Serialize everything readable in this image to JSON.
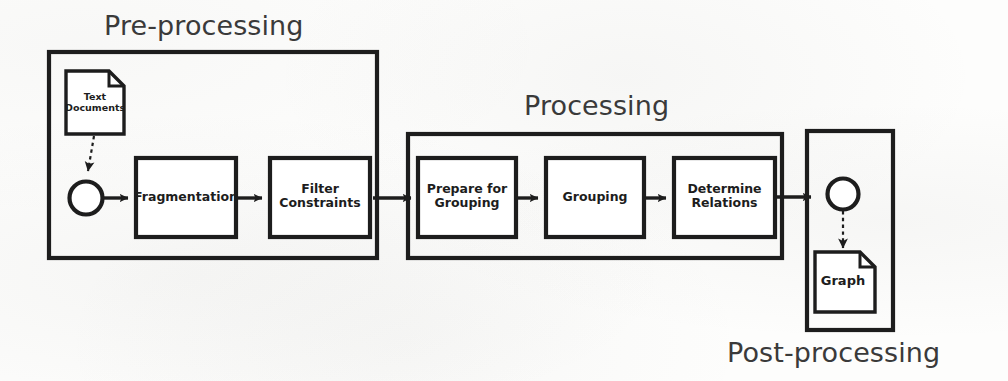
{
  "diagram": {
    "background_color": "#fdfdfc",
    "stroke_color": "#1d1d1d",
    "title_color": "#3a3a3a",
    "sections": [
      {
        "id": "pre-processing",
        "label": "Pre-processing",
        "label_position": "above-left",
        "container": {
          "x": 49,
          "y": 52,
          "w": 328,
          "h": 206
        }
      },
      {
        "id": "processing",
        "label": "Processing",
        "label_position": "above-center",
        "container": {
          "x": 408,
          "y": 134,
          "w": 374,
          "h": 124
        }
      },
      {
        "id": "post-processing",
        "label": "Post-processing",
        "label_position": "below-center",
        "container": {
          "x": 807,
          "y": 131,
          "w": 86,
          "h": 199
        }
      }
    ],
    "nodes": [
      {
        "id": "text-documents",
        "type": "document",
        "label": "Text\nDocuments",
        "x": 65,
        "y": 70,
        "w": 60,
        "h": 65,
        "section": "pre-processing"
      },
      {
        "id": "start-circle",
        "type": "circle",
        "label": "",
        "cx": 86,
        "cy": 198,
        "r": 17,
        "section": "pre-processing"
      },
      {
        "id": "fragmentation",
        "type": "process",
        "label": "Fragmentation",
        "x": 136,
        "y": 158,
        "w": 100,
        "h": 79,
        "section": "pre-processing"
      },
      {
        "id": "filter-constraints",
        "type": "process",
        "label": "Filter\nConstraints",
        "x": 270,
        "y": 158,
        "w": 100,
        "h": 79,
        "section": "pre-processing"
      },
      {
        "id": "prepare-for-grouping",
        "type": "process",
        "label": "Prepare for\nGrouping",
        "x": 418,
        "y": 158,
        "w": 98,
        "h": 79,
        "section": "processing"
      },
      {
        "id": "grouping",
        "type": "process",
        "label": "Grouping",
        "x": 546,
        "y": 158,
        "w": 98,
        "h": 79,
        "section": "processing"
      },
      {
        "id": "determine-relations",
        "type": "process",
        "label": "Determine\nRelations",
        "x": 674,
        "y": 158,
        "w": 101,
        "h": 79,
        "section": "processing"
      },
      {
        "id": "end-circle",
        "type": "circle",
        "label": "",
        "cx": 843,
        "cy": 194,
        "r": 16,
        "section": "post-processing"
      },
      {
        "id": "graph-document",
        "type": "document",
        "label": "Graph",
        "x": 814,
        "y": 251,
        "w": 62,
        "h": 62,
        "section": "post-processing"
      }
    ],
    "edges": [
      {
        "id": "documents-to-start",
        "from": "text-documents",
        "to": "start-circle",
        "style": "dashed",
        "direction": "down"
      },
      {
        "id": "start-to-fragmentation",
        "from": "start-circle",
        "to": "fragmentation",
        "style": "solid",
        "direction": "right"
      },
      {
        "id": "fragmentation-to-filter",
        "from": "fragmentation",
        "to": "filter-constraints",
        "style": "solid",
        "direction": "right"
      },
      {
        "id": "filter-to-processing",
        "from": "filter-constraints",
        "to": "prepare-for-grouping",
        "style": "solid",
        "direction": "right"
      },
      {
        "id": "prepare-to-grouping",
        "from": "prepare-for-grouping",
        "to": "grouping",
        "style": "solid",
        "direction": "right"
      },
      {
        "id": "grouping-to-determine",
        "from": "grouping",
        "to": "determine-relations",
        "style": "solid",
        "direction": "right"
      },
      {
        "id": "determine-to-end",
        "from": "determine-relations",
        "to": "end-circle",
        "style": "solid",
        "direction": "right"
      },
      {
        "id": "end-to-graph",
        "from": "end-circle",
        "to": "graph-document",
        "style": "dashed",
        "direction": "down"
      }
    ]
  }
}
